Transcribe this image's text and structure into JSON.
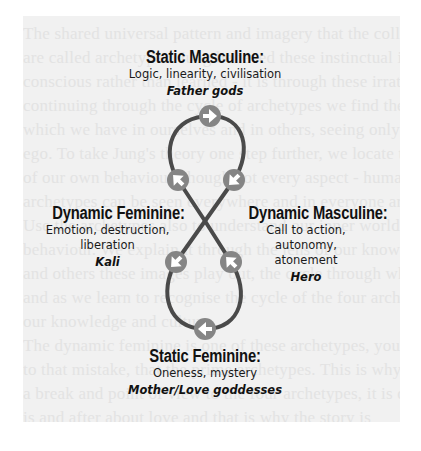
{
  "background_text_lines": [
    "The shared universal pattern and imagery that the collective",
    "are called archetypes. Jung believed these instinctual ideas recognised",
    "conscious rather than learned - it is through these irrational forms",
    "continuing through the cycle of archetypes we find the imagery of",
    "which we have in ourselves and in others, seeing only ourselves",
    "ego. To take Jung's theory one step further, we locate the",
    "of our own behaviour, though not every aspect - humans being",
    "archetypes can be seen everywhere and in everyone around",
    "Use the archetypes also to understand our inner worlds and",
    "behaviour. We explain it through the lens of our knowledge",
    "and others these images play out, the cycle through which we",
    "and as we learn to recognise the cycle of the four archetypes",
    "our knowledge and culture.",
    "The dynamic feminine is one of these archetypes, you appeal",
    "to that mistake, that the prime archetypes. This is why",
    "a break and point of view to the four archetypes, it is one time",
    "is and after about love and that is why the story is"
  ],
  "diagram": {
    "colors": {
      "path": "#4a4a4a",
      "node_fill": "#858585",
      "arrow": "#ffffff",
      "text": "#111111"
    },
    "nodes": [
      {
        "id": "top",
        "arrow": "right-arrow-icon",
        "glyph": "→"
      },
      {
        "id": "upper-left",
        "arrow": "up-left-arrow-icon",
        "glyph": "↖"
      },
      {
        "id": "upper-right",
        "arrow": "down-left-arrow-icon",
        "glyph": "↙"
      },
      {
        "id": "lower-left",
        "arrow": "down-left-arrow-icon",
        "glyph": "↙"
      },
      {
        "id": "lower-right",
        "arrow": "up-left-arrow-icon",
        "glyph": "↖"
      },
      {
        "id": "bottom",
        "arrow": "left-arrow-icon",
        "glyph": "←"
      }
    ],
    "static_masculine": {
      "heading": "Static Masculine:",
      "description": "Logic, linearity, civilisation",
      "archetype": "Father gods"
    },
    "dynamic_feminine": {
      "heading": "Dynamic Feminine:",
      "description_line1": "Emotion, destruction,",
      "description_line2": "liberation",
      "archetype": "Kali"
    },
    "dynamic_masculine": {
      "heading": "Dynamic Masculine:",
      "description_line1": "Call to action, autonomy,",
      "description_line2": "atonement",
      "archetype": "Hero"
    },
    "static_feminine": {
      "heading": "Static Feminine:",
      "description": "Oneness, mystery",
      "archetype": "Mother/Love goddesses"
    }
  }
}
